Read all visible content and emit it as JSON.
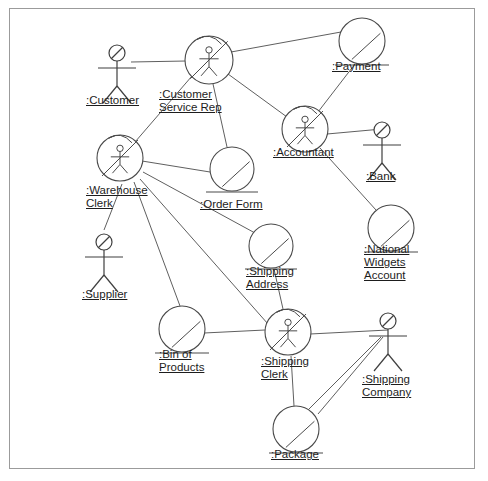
{
  "diagram": {
    "frame": {
      "x": 9,
      "y": 8,
      "width": 466,
      "height": 461,
      "border_color": "#9b9b9b"
    },
    "colors": {
      "background": "#ffffff",
      "edge": "#5f5f5f",
      "node_stroke": "#4a4a4a",
      "actor_stroke": "#3f3f3f",
      "text": "#1d1d1d"
    },
    "nodes": [
      {
        "id": "customer",
        "label": [
          ":Customer"
        ],
        "kind": "actor",
        "icon": "actor-stick-figure-icon",
        "cx": 117,
        "cy": 53,
        "label_x": 86,
        "label_y": 94,
        "align": "left"
      },
      {
        "id": "customer-service-rep",
        "label": [
          ":Customer",
          "Service Rep"
        ],
        "kind": "actor-object",
        "icon": "actor-object-circle-icon",
        "cx": 209,
        "cy": 60,
        "r": 24,
        "label_x": 159,
        "label_y": 88,
        "align": "left"
      },
      {
        "id": "payment",
        "label": [
          ":Payment"
        ],
        "kind": "entity-object",
        "icon": "entity-object-circle-icon",
        "cx": 362,
        "cy": 41,
        "r": 23,
        "label_x": 332,
        "label_y": 60,
        "align": "left"
      },
      {
        "id": "accountant",
        "label": [
          ":Accountant"
        ],
        "kind": "actor-object",
        "icon": "actor-object-circle-icon",
        "cx": 305,
        "cy": 129,
        "r": 23,
        "label_x": 273,
        "label_y": 146,
        "align": "left"
      },
      {
        "id": "bank",
        "label": [
          ":Bank"
        ],
        "kind": "actor",
        "icon": "actor-stick-figure-icon",
        "cx": 382,
        "cy": 130,
        "label_x": 366,
        "label_y": 170,
        "align": "left"
      },
      {
        "id": "warehouse-clerk",
        "label": [
          ":Warehouse",
          "Clerk"
        ],
        "kind": "actor-object",
        "icon": "actor-object-circle-icon",
        "cx": 120,
        "cy": 158,
        "r": 23,
        "label_x": 86,
        "label_y": 184,
        "align": "left"
      },
      {
        "id": "order-form",
        "label": [
          ":Order Form"
        ],
        "kind": "entity-object",
        "icon": "entity-object-circle-icon",
        "cx": 232,
        "cy": 169,
        "r": 22,
        "label_x": 200,
        "label_y": 198,
        "align": "left"
      },
      {
        "id": "national-widgets-account",
        "label": [
          ":National",
          "Widgets",
          "Account"
        ],
        "kind": "entity-object",
        "icon": "entity-object-circle-icon",
        "cx": 391,
        "cy": 228,
        "r": 23,
        "label_x": 364,
        "label_y": 243,
        "align": "left"
      },
      {
        "id": "shipping-address",
        "label": [
          ":Shipping",
          "Address"
        ],
        "kind": "entity-object",
        "icon": "entity-object-circle-icon",
        "cx": 271,
        "cy": 246,
        "r": 22,
        "label_x": 246,
        "label_y": 265,
        "align": "left"
      },
      {
        "id": "supplier",
        "label": [
          ":Supplier"
        ],
        "kind": "actor",
        "icon": "actor-stick-figure-icon",
        "cx": 104,
        "cy": 242,
        "label_x": 82,
        "label_y": 288,
        "align": "left"
      },
      {
        "id": "bin-of-products",
        "label": [
          ":Bin of",
          "Products"
        ],
        "kind": "entity-object",
        "icon": "entity-object-circle-icon",
        "cx": 182,
        "cy": 329,
        "r": 23,
        "label_x": 159,
        "label_y": 348,
        "align": "left"
      },
      {
        "id": "shipping-clerk",
        "label": [
          ":Shipping",
          "Clerk"
        ],
        "kind": "actor-object",
        "icon": "actor-object-circle-icon",
        "cx": 288,
        "cy": 332,
        "r": 23,
        "label_x": 261,
        "label_y": 355,
        "align": "left"
      },
      {
        "id": "shipping-company",
        "label": [
          ":Shipping",
          "Company"
        ],
        "kind": "actor",
        "icon": "actor-stick-figure-icon",
        "cx": 388,
        "cy": 321,
        "label_x": 362,
        "label_y": 373,
        "align": "left"
      },
      {
        "id": "package",
        "label": [
          ":Package"
        ],
        "kind": "entity-object",
        "icon": "entity-object-circle-icon",
        "cx": 296,
        "cy": 429,
        "r": 23,
        "label_x": 271,
        "label_y": 448,
        "align": "left"
      }
    ],
    "edges": [
      {
        "id": "customer--customer-service-rep",
        "from": "customer",
        "to": "customer-service-rep",
        "x1": 131,
        "y1": 62,
        "x2": 186,
        "y2": 61
      },
      {
        "id": "customer-service-rep--payment",
        "from": "customer-service-rep",
        "to": "payment",
        "x1": 231,
        "y1": 52,
        "x2": 341,
        "y2": 32
      },
      {
        "id": "customer-service-rep--accountant",
        "from": "customer-service-rep",
        "to": "accountant",
        "x1": 228,
        "y1": 74,
        "x2": 287,
        "y2": 117
      },
      {
        "id": "customer-service-rep--warehouse-clerk",
        "from": "customer-service-rep",
        "to": "warehouse-clerk",
        "x1": 192,
        "y1": 76,
        "x2": 135,
        "y2": 142
      },
      {
        "id": "customer-service-rep--order-form",
        "from": "customer-service-rep",
        "to": "order-form",
        "x1": 213,
        "y1": 84,
        "x2": 227,
        "y2": 147
      },
      {
        "id": "payment--accountant",
        "from": "payment",
        "to": "accountant",
        "x1": 355,
        "y1": 64,
        "x2": 318,
        "y2": 112
      },
      {
        "id": "accountant--bank",
        "from": "accountant",
        "to": "bank",
        "x1": 327,
        "y1": 134,
        "x2": 382,
        "y2": 129
      },
      {
        "id": "accountant--national-widgets-account",
        "from": "accountant",
        "to": "national-widgets-account",
        "x1": 320,
        "y1": 148,
        "x2": 376,
        "y2": 210
      },
      {
        "id": "warehouse-clerk--order-form",
        "from": "warehouse-clerk",
        "to": "order-form",
        "x1": 142,
        "y1": 161,
        "x2": 210,
        "y2": 172
      },
      {
        "id": "warehouse-clerk--supplier",
        "from": "warehouse-clerk",
        "to": "supplier",
        "x1": 122,
        "y1": 184,
        "x2": 104,
        "y2": 230
      },
      {
        "id": "warehouse-clerk--bin-of-products",
        "from": "warehouse-clerk",
        "to": "bin-of-products",
        "x1": 134,
        "y1": 182,
        "x2": 180,
        "y2": 306
      },
      {
        "id": "warehouse-clerk--shipping-clerk",
        "from": "warehouse-clerk",
        "to": "shipping-clerk",
        "x1": 140,
        "y1": 179,
        "x2": 268,
        "y2": 324
      },
      {
        "id": "warehouse-clerk--shipping-address",
        "from": "warehouse-clerk",
        "to": "shipping-address",
        "x1": 143,
        "y1": 172,
        "x2": 255,
        "y2": 233
      },
      {
        "id": "shipping-address--shipping-clerk",
        "from": "shipping-address",
        "to": "shipping-clerk",
        "x1": 274,
        "y1": 269,
        "x2": 283,
        "y2": 309
      },
      {
        "id": "bin-of-products--shipping-clerk",
        "from": "bin-of-products",
        "to": "shipping-clerk",
        "x1": 204,
        "y1": 333,
        "x2": 265,
        "y2": 330
      },
      {
        "id": "shipping-clerk--shipping-company",
        "from": "shipping-clerk",
        "to": "shipping-company",
        "x1": 310,
        "y1": 334,
        "x2": 388,
        "y2": 330
      },
      {
        "id": "shipping-clerk--package",
        "from": "shipping-clerk",
        "to": "package",
        "x1": 291,
        "y1": 356,
        "x2": 294,
        "y2": 406
      },
      {
        "id": "package--shipping-company",
        "from": "package",
        "to": "shipping-company",
        "x1": 318,
        "y1": 414,
        "x2": 383,
        "y2": 337
      },
      {
        "id": "shipping-company--lower-left",
        "from": "shipping-company",
        "to": "shipping-clerk",
        "x1": 381,
        "y1": 337,
        "x2": 283,
        "y2": 435
      }
    ]
  }
}
